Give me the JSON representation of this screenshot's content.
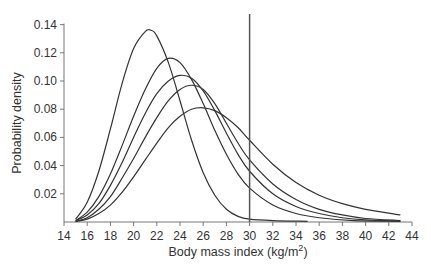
{
  "chart_data": {
    "type": "line",
    "title": "",
    "xlabel": "Body mass index (kg/m²)",
    "xlabel_main": "Body mass index (kg/m",
    "xlabel_sup": "2",
    "xlabel_end": ")",
    "ylabel": "Probability density",
    "xlim": [
      14,
      44
    ],
    "ylim": [
      0,
      0.14
    ],
    "xticks": [
      14,
      16,
      18,
      20,
      22,
      24,
      26,
      28,
      30,
      32,
      34,
      36,
      38,
      40,
      42,
      44
    ],
    "yticks": [
      "0.02",
      "0.04",
      "0.06",
      "0.08",
      "0.10",
      "0.12",
      "0.14"
    ],
    "ytick_values": [
      0.02,
      0.04,
      0.06,
      0.08,
      0.1,
      0.12,
      0.14
    ],
    "grid": false,
    "legend": null,
    "reference_line": {
      "x": 30,
      "label": "BMI 30 cut-off"
    },
    "series": [
      {
        "name": "curve-1",
        "points": [
          [
            15,
            0.002
          ],
          [
            16,
            0.014
          ],
          [
            17,
            0.036
          ],
          [
            18,
            0.066
          ],
          [
            19,
            0.098
          ],
          [
            20,
            0.123
          ],
          [
            21,
            0.135
          ],
          [
            21.5,
            0.136
          ],
          [
            22,
            0.132
          ],
          [
            23,
            0.113
          ],
          [
            24,
            0.086
          ],
          [
            25,
            0.058
          ],
          [
            26,
            0.035
          ],
          [
            27,
            0.019
          ],
          [
            28,
            0.009
          ],
          [
            29,
            0.004
          ],
          [
            30,
            0.002
          ],
          [
            32,
            0.001
          ],
          [
            35,
            0.0005
          ]
        ]
      },
      {
        "name": "curve-2",
        "points": [
          [
            15,
            0.001
          ],
          [
            16,
            0.007
          ],
          [
            17,
            0.018
          ],
          [
            18,
            0.034
          ],
          [
            19,
            0.054
          ],
          [
            20,
            0.075
          ],
          [
            21,
            0.094
          ],
          [
            22,
            0.109
          ],
          [
            23,
            0.116
          ],
          [
            24,
            0.113
          ],
          [
            25,
            0.101
          ],
          [
            26,
            0.084
          ],
          [
            27,
            0.065
          ],
          [
            28,
            0.048
          ],
          [
            29,
            0.034
          ],
          [
            30,
            0.024
          ],
          [
            32,
            0.012
          ],
          [
            34,
            0.006
          ],
          [
            36,
            0.003
          ],
          [
            39,
            0.001
          ],
          [
            43,
            0.0005
          ]
        ]
      },
      {
        "name": "curve-3",
        "points": [
          [
            15,
            0.001
          ],
          [
            16,
            0.005
          ],
          [
            17,
            0.013
          ],
          [
            18,
            0.026
          ],
          [
            19,
            0.042
          ],
          [
            20,
            0.06
          ],
          [
            21,
            0.077
          ],
          [
            22,
            0.091
          ],
          [
            23,
            0.1
          ],
          [
            24,
            0.104
          ],
          [
            25,
            0.102
          ],
          [
            26,
            0.093
          ],
          [
            27,
            0.079
          ],
          [
            28,
            0.063
          ],
          [
            29,
            0.048
          ],
          [
            30,
            0.036
          ],
          [
            32,
            0.02
          ],
          [
            34,
            0.011
          ],
          [
            36,
            0.006
          ],
          [
            38,
            0.003
          ],
          [
            40,
            0.0015
          ],
          [
            43,
            0.0007
          ]
        ]
      },
      {
        "name": "curve-4",
        "points": [
          [
            15,
            0.0005
          ],
          [
            16,
            0.003
          ],
          [
            17,
            0.009
          ],
          [
            18,
            0.018
          ],
          [
            19,
            0.031
          ],
          [
            20,
            0.045
          ],
          [
            21,
            0.06
          ],
          [
            22,
            0.074
          ],
          [
            23,
            0.086
          ],
          [
            24,
            0.094
          ],
          [
            25,
            0.097
          ],
          [
            26,
            0.094
          ],
          [
            27,
            0.084
          ],
          [
            28,
            0.07
          ],
          [
            29,
            0.056
          ],
          [
            30,
            0.044
          ],
          [
            32,
            0.027
          ],
          [
            34,
            0.016
          ],
          [
            36,
            0.009
          ],
          [
            38,
            0.005
          ],
          [
            40,
            0.0025
          ],
          [
            43,
            0.001
          ]
        ]
      },
      {
        "name": "curve-5",
        "points": [
          [
            15,
            0.0003
          ],
          [
            16,
            0.002
          ],
          [
            17,
            0.006
          ],
          [
            18,
            0.012
          ],
          [
            19,
            0.021
          ],
          [
            20,
            0.032
          ],
          [
            21,
            0.044
          ],
          [
            22,
            0.056
          ],
          [
            23,
            0.067
          ],
          [
            24,
            0.075
          ],
          [
            25,
            0.08
          ],
          [
            26,
            0.081
          ],
          [
            27,
            0.079
          ],
          [
            28,
            0.074
          ],
          [
            29,
            0.067
          ],
          [
            30,
            0.058
          ],
          [
            32,
            0.041
          ],
          [
            34,
            0.028
          ],
          [
            36,
            0.019
          ],
          [
            38,
            0.013
          ],
          [
            40,
            0.009
          ],
          [
            43,
            0.005
          ]
        ]
      }
    ]
  }
}
